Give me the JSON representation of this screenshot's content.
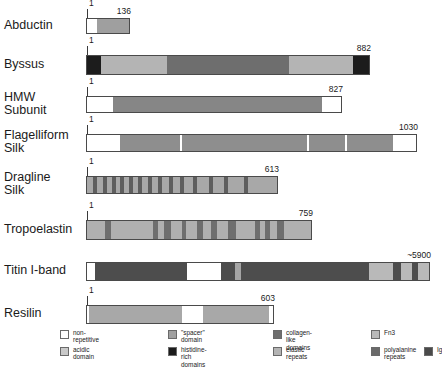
{
  "figure": {
    "type": "domain-map"
  },
  "colors": {
    "non_repetitive": "#ffffff",
    "acidic_domain": "#c9c9c9",
    "spacer_domain": "#a0a0a0",
    "histidine_rich": "#1c1c1c",
    "collagen_like": "#6e6e6e",
    "elastic_repeats": "#b4b4b4",
    "fn3": "#b9b9b9",
    "polyalanine_repeats": "#6a6a6a",
    "ig": "#4a4a4a",
    "outline": "#4a4a4a",
    "text": "#1a1a1a"
  },
  "rows": [
    {
      "label": "Abductin",
      "start_label": "1",
      "end_label": "136",
      "track": {
        "left": 86,
        "top": 18,
        "width": 44,
        "height": 16
      },
      "segments": [
        {
          "kind": "non-repetitive",
          "left": 0,
          "width": 10,
          "color": "#ffffff"
        },
        {
          "kind": "elastic-repeats",
          "left": 10,
          "width": 34,
          "color": "#9f9f9f"
        }
      ]
    },
    {
      "label": "Byssus",
      "start_label": "1",
      "end_label": "882",
      "track": {
        "left": 86,
        "top": 55,
        "width": 284,
        "height": 20
      },
      "segments": [
        {
          "kind": "histidine-rich",
          "left": 0,
          "width": 14,
          "color": "#1c1c1c"
        },
        {
          "kind": "elastic-repeats",
          "left": 14,
          "width": 66,
          "color": "#b4b4b4"
        },
        {
          "kind": "collagen-like",
          "left": 80,
          "width": 122,
          "color": "#6e6e6e"
        },
        {
          "kind": "elastic-repeats",
          "left": 202,
          "width": 64,
          "color": "#b4b4b4"
        },
        {
          "kind": "histidine-rich",
          "left": 266,
          "width": 18,
          "color": "#1c1c1c"
        }
      ]
    },
    {
      "label": "HMW\nSubunit",
      "start_label": "1",
      "end_label": "827",
      "track": {
        "left": 86,
        "top": 96,
        "width": 256,
        "height": 17
      },
      "segments": [
        {
          "kind": "non-repetitive",
          "left": 0,
          "width": 26,
          "color": "#ffffff"
        },
        {
          "kind": "spacer-domain",
          "left": 26,
          "width": 209,
          "color": "#868686"
        },
        {
          "kind": "non-repetitive",
          "left": 235,
          "width": 21,
          "color": "#ffffff"
        }
      ]
    },
    {
      "label": "Flagelliform\nSilk",
      "start_label": "1",
      "end_label": "1030",
      "track": {
        "left": 86,
        "top": 134,
        "width": 331,
        "height": 18
      },
      "segments": [
        {
          "kind": "non-repetitive",
          "left": 0,
          "width": 33,
          "color": "#ffffff"
        },
        {
          "kind": "spacer-domain",
          "left": 33,
          "width": 60,
          "color": "#8e8e8e"
        },
        {
          "kind": "spacer-domain",
          "left": 95,
          "width": 125,
          "color": "#8e8e8e"
        },
        {
          "kind": "spacer-domain",
          "left": 222,
          "width": 36,
          "color": "#8e8e8e"
        },
        {
          "kind": "spacer-domain",
          "left": 260,
          "width": 46,
          "color": "#8e8e8e"
        },
        {
          "kind": "non-repetitive",
          "left": 306,
          "width": 25,
          "color": "#ffffff"
        }
      ]
    },
    {
      "label": "Dragline\nSilk",
      "start_label": "1",
      "end_label": "613",
      "track": {
        "left": 86,
        "top": 176,
        "width": 192,
        "height": 18
      },
      "segments": [
        {
          "kind": "elastic-repeats",
          "left": 0,
          "width": 192,
          "color": "#a8a8a8"
        },
        {
          "kind": "polyalanine-repeats",
          "left": 6,
          "width": 4,
          "color": "#5e5e5e"
        },
        {
          "kind": "polyalanine-repeats",
          "left": 16,
          "width": 4,
          "color": "#5e5e5e"
        },
        {
          "kind": "polyalanine-repeats",
          "left": 25,
          "width": 4,
          "color": "#5e5e5e"
        },
        {
          "kind": "polyalanine-repeats",
          "left": 33,
          "width": 4,
          "color": "#5e5e5e"
        },
        {
          "kind": "polyalanine-repeats",
          "left": 42,
          "width": 4,
          "color": "#5e5e5e"
        },
        {
          "kind": "polyalanine-repeats",
          "left": 51,
          "width": 4,
          "color": "#5e5e5e"
        },
        {
          "kind": "polyalanine-repeats",
          "left": 61,
          "width": 4,
          "color": "#5e5e5e"
        },
        {
          "kind": "polyalanine-repeats",
          "left": 71,
          "width": 4,
          "color": "#5e5e5e"
        },
        {
          "kind": "polyalanine-repeats",
          "left": 82,
          "width": 4,
          "color": "#5e5e5e"
        },
        {
          "kind": "polyalanine-repeats",
          "left": 93,
          "width": 4,
          "color": "#5e5e5e"
        },
        {
          "kind": "polyalanine-repeats",
          "left": 106,
          "width": 4,
          "color": "#5e5e5e"
        },
        {
          "kind": "polyalanine-repeats",
          "left": 122,
          "width": 4,
          "color": "#5e5e5e"
        },
        {
          "kind": "polyalanine-repeats",
          "left": 137,
          "width": 4,
          "color": "#5e5e5e"
        },
        {
          "kind": "polyalanine-repeats",
          "left": 157,
          "width": 4,
          "color": "#5e5e5e"
        }
      ]
    },
    {
      "label": "Tropoelastin",
      "start_label": "1",
      "end_label": "759",
      "track": {
        "left": 86,
        "top": 220,
        "width": 226,
        "height": 20
      },
      "segments": [
        {
          "kind": "elastic-repeats",
          "left": 0,
          "width": 226,
          "color": "#b0b0b0"
        },
        {
          "kind": "collagen-like",
          "left": 18,
          "width": 6,
          "color": "#6e6e6e"
        },
        {
          "kind": "collagen-like",
          "left": 66,
          "width": 5,
          "color": "#6e6e6e"
        },
        {
          "kind": "collagen-like",
          "left": 77,
          "width": 7,
          "color": "#6e6e6e"
        },
        {
          "kind": "collagen-like",
          "left": 95,
          "width": 4,
          "color": "#6e6e6e"
        },
        {
          "kind": "collagen-like",
          "left": 110,
          "width": 6,
          "color": "#6e6e6e"
        },
        {
          "kind": "collagen-like",
          "left": 124,
          "width": 6,
          "color": "#6e6e6e"
        },
        {
          "kind": "collagen-like",
          "left": 141,
          "width": 8,
          "color": "#6e6e6e"
        },
        {
          "kind": "collagen-like",
          "left": 168,
          "width": 5,
          "color": "#6e6e6e"
        },
        {
          "kind": "collagen-like",
          "left": 178,
          "width": 5,
          "color": "#6e6e6e"
        },
        {
          "kind": "collagen-like",
          "left": 190,
          "width": 7,
          "color": "#6e6e6e"
        }
      ]
    },
    {
      "label": "Titin I-band",
      "start_label": "",
      "end_label": "~5900",
      "track": {
        "left": 86,
        "top": 262,
        "width": 344,
        "height": 19
      },
      "segments": [
        {
          "kind": "fn3",
          "left": 0,
          "width": 344,
          "color": "#b9b9b9"
        },
        {
          "kind": "non-repetitive",
          "left": 0,
          "width": 8,
          "color": "#ffffff"
        },
        {
          "kind": "ig",
          "left": 8,
          "width": 92,
          "color": "#4d4d4d"
        },
        {
          "kind": "non-repetitive",
          "left": 100,
          "width": 34,
          "color": "#ffffff"
        },
        {
          "kind": "ig",
          "left": 134,
          "width": 14,
          "color": "#4d4d4d"
        },
        {
          "kind": "elastic-repeats",
          "left": 148,
          "width": 6,
          "color": "#a5a5a5"
        },
        {
          "kind": "ig",
          "left": 154,
          "width": 128,
          "color": "#4d4d4d"
        },
        {
          "kind": "fn3",
          "left": 282,
          "width": 24,
          "color": "#b9b9b9"
        },
        {
          "kind": "ig",
          "left": 306,
          "width": 8,
          "color": "#4d4d4d"
        },
        {
          "kind": "fn3",
          "left": 314,
          "width": 11,
          "color": "#b9b9b9"
        },
        {
          "kind": "ig",
          "left": 325,
          "width": 6,
          "color": "#4d4d4d"
        },
        {
          "kind": "fn3",
          "left": 331,
          "width": 13,
          "color": "#b9b9b9"
        }
      ]
    },
    {
      "label": "Resilin",
      "start_label": "1",
      "end_label": "603",
      "track": {
        "left": 86,
        "top": 305,
        "width": 188,
        "height": 19
      },
      "segments": [
        {
          "kind": "non-repetitive",
          "left": 0,
          "width": 188,
          "color": "#ffffff"
        },
        {
          "kind": "elastic-repeats",
          "left": 2,
          "width": 93,
          "color": "#a8a8a8"
        },
        {
          "kind": "elastic-repeats",
          "left": 116,
          "width": 66,
          "color": "#a8a8a8"
        }
      ]
    }
  ],
  "legend": {
    "items": [
      {
        "label": "non-repetitive",
        "color": "#ffffff",
        "left": 0,
        "top": 0
      },
      {
        "label": "acidic domain",
        "color": "#c9c9c9",
        "left": 0,
        "top": 17
      },
      {
        "label": "\"spacer\" domain",
        "color": "#a0a0a0",
        "left": 108,
        "top": 0
      },
      {
        "label": "histidine-rich\ndomains",
        "color": "#1c1c1c",
        "left": 108,
        "top": 17
      },
      {
        "label": "collagen-like domains",
        "color": "#6e6e6e",
        "left": 213,
        "top": 0
      },
      {
        "label": "elastic repeats",
        "color": "#b4b4b4",
        "left": 213,
        "top": 17
      },
      {
        "label": "Fn3",
        "color": "#b9b9b9",
        "left": 311,
        "top": 0
      },
      {
        "label": "polyalanine\nrepeats",
        "color": "#6a6a6a",
        "left": 311,
        "top": 17
      },
      {
        "label": "Ig",
        "color": "#4a4a4a",
        "left": 364,
        "top": 17
      }
    ]
  }
}
